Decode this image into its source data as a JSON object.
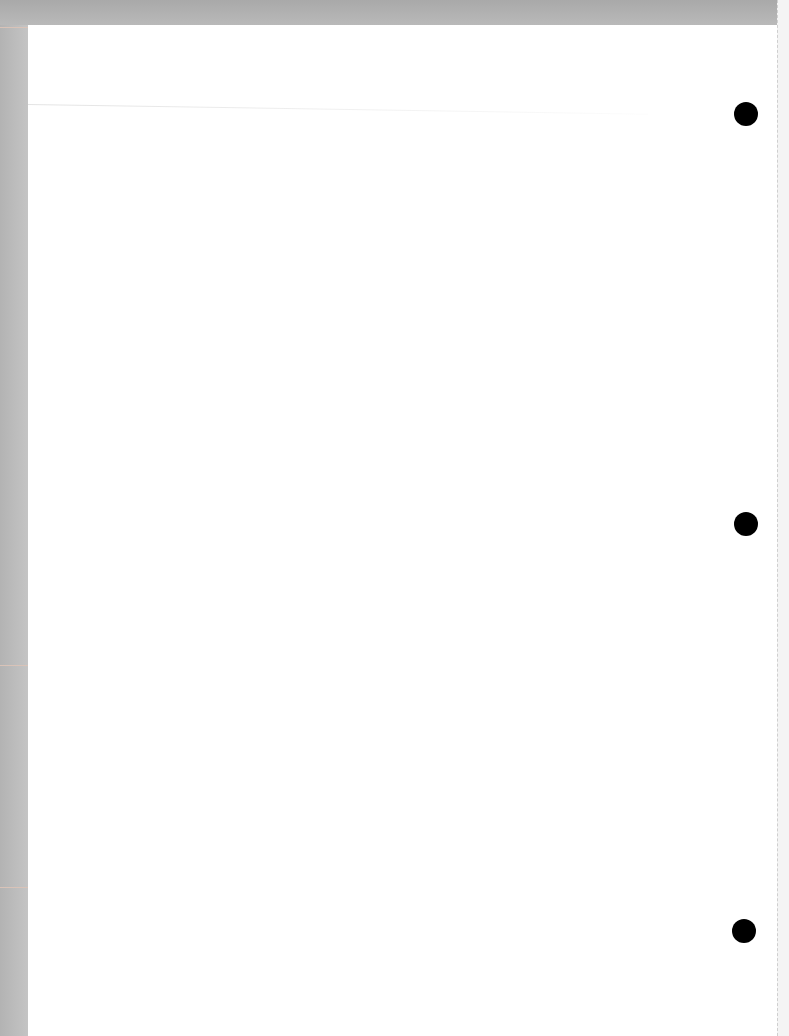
{
  "document": {
    "type": "blank scanned page",
    "text": "",
    "punch_holes": [
      {
        "x": 746,
        "y": 114
      },
      {
        "x": 746,
        "y": 524
      },
      {
        "x": 744,
        "y": 931
      }
    ],
    "colors": {
      "page": "#ffffff",
      "background": "#bdbdbd",
      "holes": "#000000"
    }
  }
}
